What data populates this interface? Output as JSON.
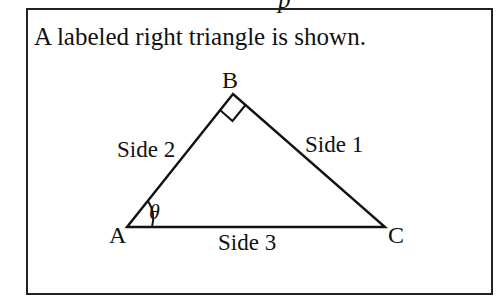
{
  "caption": "A labeled right triangle is shown.",
  "top_fragment": "p",
  "triangle": {
    "vertices": {
      "A": "A",
      "B": "B",
      "C": "C"
    },
    "sides": {
      "side1": "Side 1",
      "side2": "Side 2",
      "side3": "Side 3"
    },
    "angle_label": "θ",
    "right_angle_at": "B"
  },
  "colors": {
    "stroke": "#111111",
    "background": "#ffffff"
  }
}
